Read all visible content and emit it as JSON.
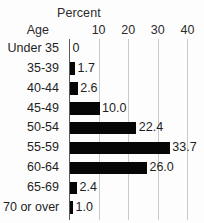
{
  "chart_data": {
    "type": "bar",
    "orientation": "horizontal",
    "title": "Percent",
    "xlabel": "Percent",
    "ylabel": "Age",
    "categories": [
      "Under 35",
      "35-39",
      "40-44",
      "45-49",
      "50-54",
      "55-59",
      "60-64",
      "65-69",
      "70 or over"
    ],
    "values": [
      0,
      1.7,
      2.6,
      10.0,
      22.4,
      33.7,
      26.0,
      2.4,
      1.0
    ],
    "value_labels": [
      "0",
      "1.7",
      "2.6",
      "10.0",
      "22.4",
      "33.7",
      "26.0",
      "2.4",
      "1.0"
    ],
    "xticks": [
      10,
      20,
      30,
      40
    ],
    "xtick_labels": [
      "10",
      "20",
      "30",
      "40"
    ],
    "xlim": [
      0,
      45.6
    ],
    "grid": true,
    "legend": false,
    "bar_color": "#060606",
    "grid_color": "#c9c9c9",
    "axis_color": "#5a5a5a",
    "background_color": "#fdfdfd",
    "text_color": "#1e1e1e"
  }
}
